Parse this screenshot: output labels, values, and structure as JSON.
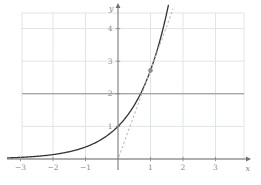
{
  "figure": {
    "background_color": "#ffffff"
  },
  "chart_data": {
    "type": "line",
    "title": "",
    "xlabel": "x",
    "ylabel": "y",
    "xlim": [
      -3.45,
      4.1
    ],
    "ylim": [
      0,
      4.75
    ],
    "grid": true,
    "x_tick_values": [
      -3,
      -2,
      -1,
      1,
      2,
      3
    ],
    "x_tick_labels": [
      "−3",
      "−2",
      "−1",
      "1",
      "2",
      "3"
    ],
    "y_tick_values": [
      1,
      2,
      3,
      4
    ],
    "y_tick_labels": [
      "1",
      "2",
      "3",
      "4"
    ],
    "grid_x_lines": [
      -2,
      -1,
      1,
      2,
      3
    ],
    "grid_y_lines": [
      1,
      2,
      3,
      4
    ],
    "series": [
      {
        "name": "exponential curve y = e^x",
        "kind": "exponential",
        "base": 2.718281828,
        "x_range": [
          -3.4,
          1.558
        ],
        "style": "solid",
        "color": "#333333",
        "width": 1.3
      },
      {
        "name": "horizontal line y = 2",
        "kind": "hline",
        "y": 2,
        "style": "solid",
        "color": "#8f8f8f",
        "width": 1.1
      },
      {
        "name": "tangent line at (1, e), y = e*x",
        "kind": "line",
        "through": [
          1,
          2.718281828
        ],
        "slope": 2.718281828,
        "y_range": [
          0.08,
          4.6
        ],
        "style": "dotted",
        "color": "#bdbdbd",
        "width": 1.1
      }
    ],
    "points": [
      {
        "x": 1,
        "y": 2.718281828,
        "color": "#8d8d8d",
        "radius": 2.3
      }
    ],
    "colors": {
      "grid": "#dee4ee",
      "axis": "#6e6e6e",
      "tick_text": "#8b8b8b"
    },
    "layout": {
      "width": 261,
      "height": 185,
      "origin_px": [
        118,
        159
      ],
      "unit_px": [
        32.5,
        32.6
      ],
      "grid_bounds_px": {
        "left": 22,
        "right": 244,
        "top": 13,
        "bottom": 159
      },
      "axis_px": {
        "x_start": 7,
        "x_end": 247,
        "x_tip": 251,
        "y_bottom": 170,
        "y_top": 7,
        "y_tip": 3
      },
      "tick_len": 2.2,
      "tick_font_size": 7.5,
      "axis_label_font_size": 8
    }
  }
}
